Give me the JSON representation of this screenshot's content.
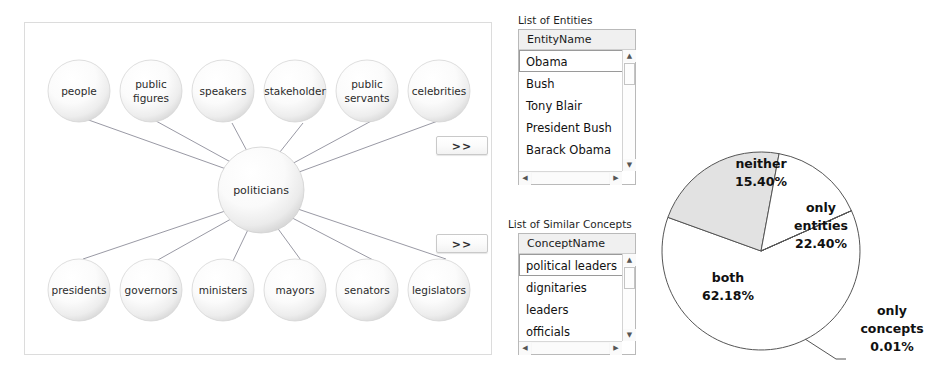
{
  "graph": {
    "center_node": "politicians",
    "top_nodes": [
      "people",
      "public figures",
      "speakers",
      "stakeholder",
      "public servants",
      "celebrities"
    ],
    "bottom_nodes": [
      "presidents",
      "governors",
      "ministers",
      "mayors",
      "senators",
      "legislators"
    ],
    "expand_entities_label": ">>",
    "expand_concepts_label": ">>"
  },
  "entities_list": {
    "title": "List of Entities",
    "column_header": "EntityName",
    "rows": [
      "Obama",
      "Bush",
      "Tony Blair",
      "President Bush",
      "Barack Obama"
    ],
    "selected_row": "Obama",
    "scroll_up_glyph": "▲",
    "scroll_down_glyph": "▼",
    "scroll_left_glyph": "◀",
    "scroll_right_glyph": "▶"
  },
  "concepts_list": {
    "title": "List of Similar Concepts",
    "column_header": "ConceptName",
    "rows": [
      "political leaders",
      "dignitaries",
      "leaders",
      "officials"
    ],
    "selected_row": "political leaders",
    "scroll_up_glyph": "▲",
    "scroll_down_glyph": "▼",
    "scroll_left_glyph": "◀",
    "scroll_right_glyph": "▶"
  },
  "chart_data": {
    "type": "pie",
    "title": "",
    "labels": [
      "both",
      "only entities",
      "neither",
      "only concepts"
    ],
    "values": [
      62.18,
      22.4,
      15.4,
      0.01
    ],
    "value_labels": [
      "62.18%",
      "22.40%",
      "15.40%",
      "0.01%"
    ],
    "colors": [
      "#ffffff",
      "#e2e2e2",
      "#ffffff",
      "#ffffff"
    ],
    "stroke": "#555555",
    "legend": "none",
    "label_placement": "callout",
    "slice_text": {
      "both_line1": "both",
      "both_line2": "62.18%",
      "only_entities_line1": "only",
      "only_entities_line2": "entities",
      "only_entities_line3": "22.40%",
      "neither_line1": "neither",
      "neither_line2": "15.40%",
      "only_concepts_line1": "only",
      "only_concepts_line2": "concepts",
      "only_concepts_line3": "0.01%"
    }
  }
}
